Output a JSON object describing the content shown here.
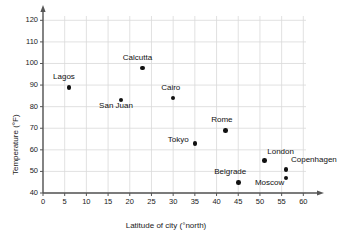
{
  "chart_data": {
    "type": "scatter",
    "title": "",
    "xlabel": "Latitude of city (°north)",
    "ylabel": "Temperature (°F)",
    "xlim": [
      0,
      62
    ],
    "ylim": [
      40,
      122
    ],
    "xticks": [
      0,
      5,
      10,
      15,
      20,
      25,
      30,
      35,
      40,
      45,
      50,
      55,
      60
    ],
    "yticks": [
      40,
      50,
      60,
      70,
      80,
      90,
      100,
      110,
      120
    ],
    "grid": true,
    "legend": "none",
    "marker_color": "#111111",
    "grid_color": "#d9d9d9",
    "axis_color": "#555555",
    "points": [
      {
        "label": "Lagos",
        "x": 6,
        "y": 89,
        "label_dx": -16,
        "label_dy": -12
      },
      {
        "label": "Calcutta",
        "x": 23,
        "y": 98,
        "label_dx": -20,
        "label_dy": -12
      },
      {
        "label": "San Juan",
        "x": 18,
        "y": 83,
        "label_dx": -22,
        "label_dy": 4
      },
      {
        "label": "Cairo",
        "x": 30,
        "y": 84,
        "label_dx": -12,
        "label_dy": -12
      },
      {
        "label": "Tokyo",
        "x": 35,
        "y": 63,
        "label_dx": -27,
        "label_dy": -5
      },
      {
        "label": "Rome",
        "x": 42,
        "y": 69,
        "label_dx": -14,
        "label_dy": -12
      },
      {
        "label": "Belgrade",
        "x": 45,
        "y": 45,
        "label_dx": -24,
        "label_dy": -12
      },
      {
        "label": "London",
        "x": 51,
        "y": 55,
        "label_dx": 3,
        "label_dy": -11
      },
      {
        "label": "Copenhagen",
        "x": 56,
        "y": 51,
        "label_dx": 5,
        "label_dy": -11
      },
      {
        "label": "Moscow",
        "x": 56,
        "y": 47,
        "label_dx": -31,
        "label_dy": 3
      }
    ]
  }
}
